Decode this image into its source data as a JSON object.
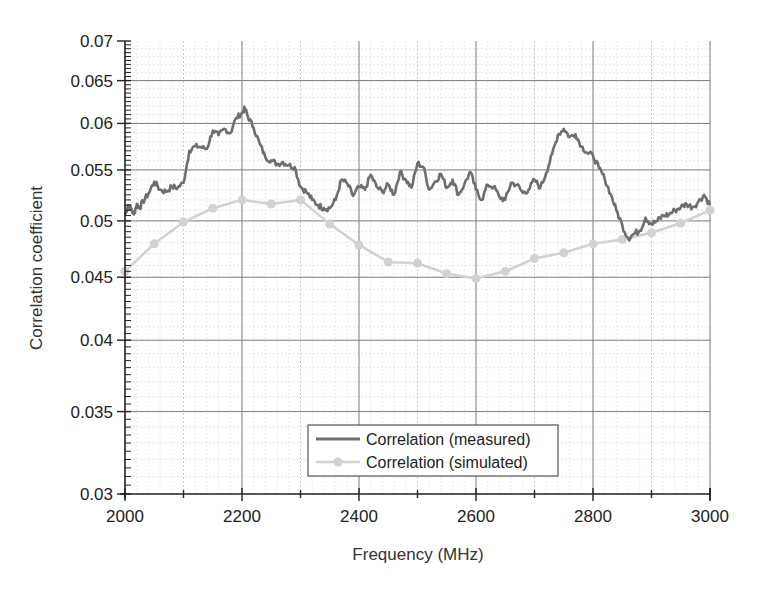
{
  "chart_data": {
    "type": "line",
    "title": "",
    "xlabel": "Frequency (MHz)",
    "ylabel": "Correlation coefficient",
    "xlim": [
      2000,
      3000
    ],
    "ylim": [
      0.03,
      0.07
    ],
    "yscale": "log",
    "grid": true,
    "x_ticks": [
      2000,
      2200,
      2400,
      2600,
      2800,
      3000
    ],
    "x_tick_labels": [
      "2000",
      "2200",
      "2400",
      "2600",
      "2800",
      "3000"
    ],
    "y_ticks": [
      0.03,
      0.035,
      0.04,
      0.045,
      0.05,
      0.055,
      0.06,
      0.065,
      0.07
    ],
    "y_tick_labels": [
      "0.03",
      "0.035",
      "0.04",
      "0.045",
      "0.05",
      "0.055",
      "0.06",
      "0.065",
      "0.07"
    ],
    "legend_position": "lower center",
    "series": [
      {
        "name": "Correlation (measured)",
        "color": "#6e6e6e",
        "marker": "none",
        "x": [
          2000,
          2005,
          2010,
          2015,
          2020,
          2025,
          2030,
          2040,
          2050,
          2060,
          2070,
          2080,
          2090,
          2100,
          2110,
          2120,
          2130,
          2140,
          2150,
          2160,
          2170,
          2180,
          2190,
          2200,
          2205,
          2210,
          2220,
          2230,
          2240,
          2250,
          2260,
          2270,
          2280,
          2290,
          2300,
          2310,
          2320,
          2330,
          2340,
          2350,
          2360,
          2370,
          2380,
          2390,
          2400,
          2410,
          2420,
          2430,
          2440,
          2450,
          2460,
          2470,
          2480,
          2490,
          2500,
          2510,
          2520,
          2530,
          2540,
          2550,
          2560,
          2570,
          2580,
          2590,
          2600,
          2610,
          2620,
          2630,
          2640,
          2650,
          2660,
          2670,
          2680,
          2690,
          2700,
          2710,
          2720,
          2730,
          2740,
          2750,
          2760,
          2770,
          2780,
          2790,
          2800,
          2810,
          2820,
          2830,
          2840,
          2850,
          2860,
          2870,
          2880,
          2890,
          2900,
          2910,
          2920,
          2930,
          2940,
          2950,
          2960,
          2970,
          2980,
          2990,
          3000
        ],
        "values": [
          0.0505,
          0.0515,
          0.0512,
          0.0506,
          0.0516,
          0.0512,
          0.0518,
          0.0526,
          0.0538,
          0.053,
          0.0528,
          0.0533,
          0.0532,
          0.0537,
          0.057,
          0.0575,
          0.0574,
          0.0572,
          0.0592,
          0.0587,
          0.0594,
          0.0589,
          0.0606,
          0.0612,
          0.0617,
          0.0608,
          0.0595,
          0.0578,
          0.0563,
          0.056,
          0.0556,
          0.0558,
          0.0555,
          0.0553,
          0.0533,
          0.0528,
          0.052,
          0.0515,
          0.0512,
          0.0512,
          0.052,
          0.054,
          0.0536,
          0.0524,
          0.0533,
          0.053,
          0.0545,
          0.0533,
          0.0528,
          0.0535,
          0.0525,
          0.0548,
          0.054,
          0.0532,
          0.0557,
          0.0553,
          0.053,
          0.0538,
          0.0546,
          0.0532,
          0.054,
          0.0525,
          0.0535,
          0.0548,
          0.053,
          0.052,
          0.0535,
          0.0533,
          0.0523,
          0.052,
          0.0537,
          0.0535,
          0.0527,
          0.053,
          0.054,
          0.0532,
          0.0547,
          0.0566,
          0.0587,
          0.0594,
          0.0585,
          0.0588,
          0.0575,
          0.0568,
          0.0565,
          0.0552,
          0.0541,
          0.0526,
          0.051,
          0.0496,
          0.0484,
          0.0488,
          0.0491,
          0.0503,
          0.0497,
          0.05,
          0.0505,
          0.0506,
          0.051,
          0.0513,
          0.0516,
          0.0513,
          0.0518,
          0.0525,
          0.0515
        ]
      },
      {
        "name": "Correlation (simulated)",
        "color": "#d2d2d2",
        "marker": "circle",
        "x": [
          2000,
          2050,
          2100,
          2150,
          2200,
          2250,
          2300,
          2350,
          2400,
          2450,
          2500,
          2550,
          2600,
          2650,
          2700,
          2750,
          2800,
          2850,
          2900,
          2950,
          3000
        ],
        "values": [
          0.0455,
          0.0479,
          0.0499,
          0.0512,
          0.052,
          0.0516,
          0.052,
          0.0497,
          0.0478,
          0.0463,
          0.0462,
          0.0453,
          0.0449,
          0.0455,
          0.0466,
          0.0471,
          0.0479,
          0.0483,
          0.0489,
          0.0498,
          0.051
        ]
      }
    ]
  },
  "legend": {
    "measured_label": "Correlation (measured)",
    "simulated_label": "Correlation (simulated)"
  },
  "axes": {
    "x_title": "Frequency (MHz)",
    "y_title": "Correlation coefficient"
  }
}
